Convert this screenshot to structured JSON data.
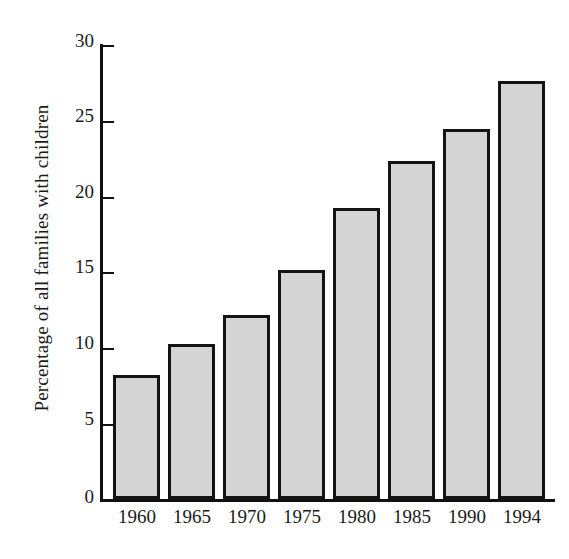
{
  "chart_data": {
    "type": "bar",
    "title": "",
    "xlabel": "",
    "ylabel": "Percentage of all families with children",
    "categories": [
      "1960",
      "1965",
      "1970",
      "1975",
      "1980",
      "1985",
      "1990",
      "1994"
    ],
    "values": [
      8.1,
      10.1,
      12.0,
      15.0,
      19.0,
      22.1,
      24.2,
      27.3
    ],
    "ylim": [
      0,
      30
    ],
    "yticks": [
      0,
      5,
      10,
      15,
      20,
      25,
      30
    ],
    "ytick_labels": [
      "0",
      "5",
      "10",
      "15",
      "20",
      "25",
      "30"
    ],
    "grid": false,
    "legend": "none",
    "bar_fill_color": "#d4d4d4",
    "bar_edge_color": "#141414",
    "axis_color": "#111111",
    "background_color": "#ffffff"
  }
}
